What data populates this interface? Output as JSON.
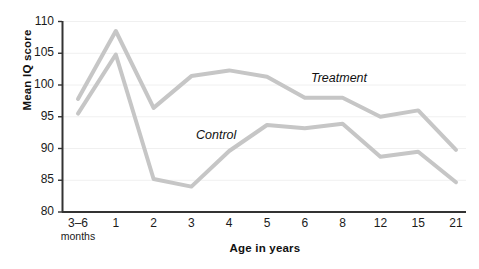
{
  "chart_data": {
    "type": "line",
    "title": "",
    "xlabel": "Age in years",
    "ylabel": "Mean IQ score",
    "ylim": [
      80,
      110
    ],
    "ytick_values": [
      80,
      85,
      90,
      95,
      100,
      105,
      110
    ],
    "ytick_labels": [
      "80",
      "85",
      "90",
      "95",
      "100",
      "105",
      "110"
    ],
    "grid": "horizontal",
    "legend_position": "inline-annotations",
    "categories": [
      "3–6 months",
      "1",
      "2",
      "3",
      "4",
      "5",
      "6",
      "8",
      "12",
      "15",
      "21"
    ],
    "category_labels": [
      {
        "main": "3–6",
        "sub": "months"
      },
      {
        "main": "1",
        "sub": ""
      },
      {
        "main": "2",
        "sub": ""
      },
      {
        "main": "3",
        "sub": ""
      },
      {
        "main": "4",
        "sub": ""
      },
      {
        "main": "5",
        "sub": ""
      },
      {
        "main": "6",
        "sub": ""
      },
      {
        "main": "8",
        "sub": ""
      },
      {
        "main": "12",
        "sub": ""
      },
      {
        "main": "15",
        "sub": ""
      },
      {
        "main": "21",
        "sub": ""
      }
    ],
    "series": [
      {
        "name": "Treatment",
        "color": "#c6c6c6",
        "values": [
          97.8,
          108.5,
          96.4,
          101.4,
          102.3,
          101.3,
          98.0,
          98.0,
          95.0,
          96.0,
          89.8
        ]
      },
      {
        "name": "Control",
        "color": "#c6c6c6",
        "values": [
          95.5,
          104.8,
          85.2,
          84.0,
          89.6,
          93.7,
          93.2,
          93.9,
          88.7,
          89.5,
          84.7
        ]
      }
    ],
    "annotations": [
      {
        "text": "Treatment",
        "x_px": 311,
        "y_px": 71
      },
      {
        "text": "Control",
        "x_px": 196,
        "y_px": 128
      }
    ],
    "colors": {
      "axis": "#333333",
      "grid": "#f0f0f0",
      "line": "#c6c6c6",
      "text": "#1a1a1a",
      "background": "#ffffff"
    }
  }
}
